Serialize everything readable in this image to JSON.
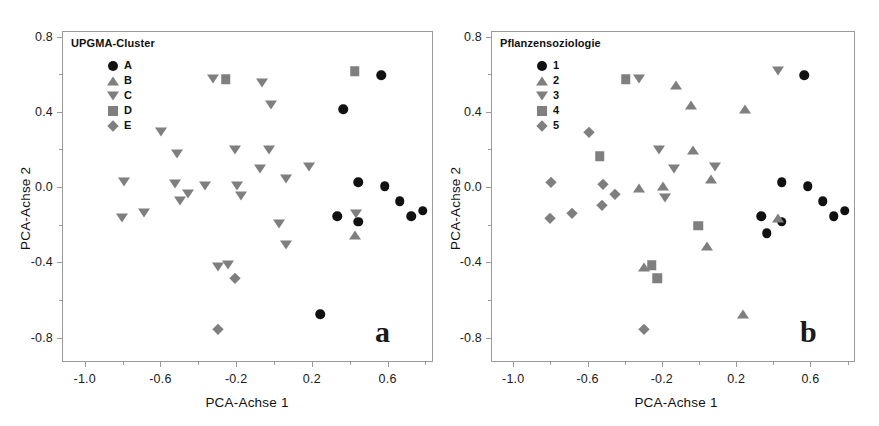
{
  "figure": {
    "width": 879,
    "height": 426,
    "background": "#ffffff",
    "marker_gray": "#7f7f7f",
    "marker_black": "#111111",
    "axis_color": "#9a9a9a"
  },
  "chart_data": [
    {
      "type": "scatter",
      "panel_letter": "a",
      "title": "",
      "legend_title": "UPGMA-Cluster",
      "legend_position": "top-left-inside",
      "xlabel": "PCA-Achse 1",
      "ylabel": "PCA-Achse 2",
      "xlim": [
        -1.12,
        0.84
      ],
      "ylim": [
        -0.93,
        0.83
      ],
      "xticks": [
        -1.0,
        -0.6,
        -0.2,
        0.2,
        0.6
      ],
      "xtick_labels": [
        "-1.0",
        "-0.6",
        "-0.2",
        "0.2",
        "0.6"
      ],
      "yticks": [
        0.8,
        0.4,
        0.0,
        -0.4,
        -0.8
      ],
      "ytick_labels": [
        "0.8",
        "0.4",
        "0.0",
        "-0.4",
        "-0.8"
      ],
      "xticks_minor": [
        -0.8,
        -0.4,
        0.0,
        0.4,
        0.8
      ],
      "yticks_minor": [
        0.6,
        0.2,
        -0.2,
        -0.6
      ],
      "grid": false,
      "series": [
        {
          "name": "A",
          "marker": "circle",
          "color": "#111111",
          "points": [
            [
              0.36,
              0.42
            ],
            [
              0.56,
              0.6
            ],
            [
              0.44,
              0.03
            ],
            [
              0.58,
              0.01
            ],
            [
              0.66,
              -0.07
            ],
            [
              0.72,
              -0.15
            ],
            [
              0.78,
              -0.12
            ],
            [
              0.33,
              -0.15
            ],
            [
              0.44,
              -0.18
            ],
            [
              0.24,
              -0.67
            ]
          ]
        },
        {
          "name": "B",
          "marker": "triangle-up",
          "color": "#7f7f7f",
          "points": [
            [
              0.42,
              -0.25
            ]
          ]
        },
        {
          "name": "C",
          "marker": "triangle-down",
          "color": "#7f7f7f",
          "points": [
            [
              -0.33,
              0.58
            ],
            [
              -0.07,
              0.56
            ],
            [
              -0.02,
              0.44
            ],
            [
              -0.6,
              0.3
            ],
            [
              -0.52,
              0.18
            ],
            [
              -0.21,
              0.2
            ],
            [
              -0.03,
              0.2
            ],
            [
              -0.8,
              0.03
            ],
            [
              -0.53,
              0.02
            ],
            [
              -0.37,
              0.01
            ],
            [
              -0.2,
              0.01
            ],
            [
              -0.08,
              0.1
            ],
            [
              0.06,
              0.05
            ],
            [
              0.18,
              0.11
            ],
            [
              -0.5,
              -0.07
            ],
            [
              -0.46,
              -0.03
            ],
            [
              -0.18,
              -0.04
            ],
            [
              -0.81,
              -0.16
            ],
            [
              -0.69,
              -0.13
            ],
            [
              0.43,
              -0.14
            ],
            [
              0.02,
              -0.19
            ],
            [
              0.06,
              -0.3
            ],
            [
              -0.3,
              -0.42
            ],
            [
              -0.25,
              -0.41
            ]
          ]
        },
        {
          "name": "D",
          "marker": "square",
          "color": "#7f7f7f",
          "points": [
            [
              -0.26,
              0.58
            ],
            [
              0.42,
              0.62
            ]
          ]
        },
        {
          "name": "E",
          "marker": "diamond",
          "color": "#7f7f7f",
          "points": [
            [
              -0.21,
              -0.48
            ],
            [
              -0.3,
              -0.75
            ]
          ]
        }
      ]
    },
    {
      "type": "scatter",
      "panel_letter": "b",
      "title": "",
      "legend_title": "Pflanzensoziologie",
      "legend_position": "top-left-inside",
      "xlabel": "PCA-Achse 1",
      "ylabel": "PCA-Achse 2",
      "xlim": [
        -1.12,
        0.84
      ],
      "ylim": [
        -0.93,
        0.83
      ],
      "xticks": [
        -1.0,
        -0.6,
        -0.2,
        0.2,
        0.6
      ],
      "xtick_labels": [
        "-1.0",
        "-0.6",
        "-0.2",
        "0.2",
        "0.6"
      ],
      "yticks": [
        0.8,
        0.4,
        0.0,
        -0.4,
        -0.8
      ],
      "ytick_labels": [
        "0.8",
        "0.4",
        "0.0",
        "-0.4",
        "-0.8"
      ],
      "xticks_minor": [
        -0.8,
        -0.4,
        0.0,
        0.4,
        0.8
      ],
      "yticks_minor": [
        0.6,
        0.2,
        -0.2,
        -0.6
      ],
      "grid": false,
      "series": [
        {
          "name": "1",
          "marker": "circle",
          "color": "#111111",
          "points": [
            [
              0.56,
              0.6
            ],
            [
              0.44,
              0.03
            ],
            [
              0.58,
              0.01
            ],
            [
              0.66,
              -0.07
            ],
            [
              0.72,
              -0.15
            ],
            [
              0.78,
              -0.12
            ],
            [
              0.33,
              -0.15
            ],
            [
              0.44,
              -0.18
            ],
            [
              0.36,
              -0.24
            ]
          ]
        },
        {
          "name": "2",
          "marker": "triangle-up",
          "color": "#7f7f7f",
          "points": [
            [
              -0.13,
              0.55
            ],
            [
              -0.05,
              0.44
            ],
            [
              0.24,
              0.42
            ],
            [
              -0.04,
              0.2
            ],
            [
              -0.2,
              0.01
            ],
            [
              -0.33,
              0.0
            ],
            [
              0.06,
              0.05
            ],
            [
              0.42,
              -0.16
            ],
            [
              0.04,
              -0.31
            ],
            [
              -0.3,
              -0.42
            ],
            [
              0.23,
              -0.67
            ]
          ]
        },
        {
          "name": "3",
          "marker": "triangle-down",
          "color": "#7f7f7f",
          "points": [
            [
              -0.33,
              0.58
            ],
            [
              0.42,
              0.62
            ],
            [
              -0.22,
              0.2
            ],
            [
              -0.14,
              0.1
            ],
            [
              0.08,
              0.11
            ],
            [
              -0.19,
              -0.05
            ]
          ]
        },
        {
          "name": "4",
          "marker": "square",
          "color": "#7f7f7f",
          "points": [
            [
              -0.4,
              0.58
            ],
            [
              -0.54,
              0.17
            ],
            [
              -0.01,
              -0.2
            ],
            [
              -0.26,
              -0.41
            ],
            [
              -0.23,
              -0.48
            ]
          ]
        },
        {
          "name": "5",
          "marker": "diamond",
          "color": "#7f7f7f",
          "points": [
            [
              -0.6,
              0.3
            ],
            [
              -0.52,
              0.02
            ],
            [
              -0.8,
              0.03
            ],
            [
              -0.46,
              -0.03
            ],
            [
              -0.53,
              -0.09
            ],
            [
              -0.81,
              -0.16
            ],
            [
              -0.69,
              -0.13
            ],
            [
              -0.3,
              -0.75
            ]
          ]
        }
      ]
    }
  ]
}
